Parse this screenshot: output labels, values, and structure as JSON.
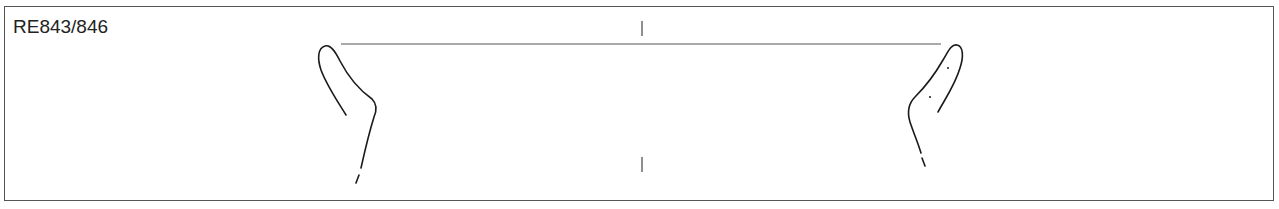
{
  "figure": {
    "label": "RE843/846",
    "type": "pottery-profile-drawing",
    "colors": {
      "line": "#1a1a1a",
      "frame": "#555555",
      "background": "#ffffff"
    }
  }
}
